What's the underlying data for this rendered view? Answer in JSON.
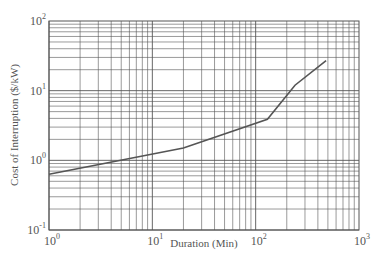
{
  "chart_data": {
    "type": "line",
    "title": "",
    "xlabel": "Duration (Min)",
    "ylabel": "Cost of Interruption ($/kW)",
    "xscale": "log",
    "yscale": "log",
    "xlim": [
      1,
      1000
    ],
    "ylim": [
      0.1,
      100
    ],
    "grid": true,
    "x_ticks": [
      {
        "base": "10",
        "exp": "0",
        "value": 1
      },
      {
        "base": "10",
        "exp": "1",
        "value": 10
      },
      {
        "base": "10",
        "exp": "2",
        "value": 100
      },
      {
        "base": "10",
        "exp": "3",
        "value": 1000
      }
    ],
    "y_ticks": [
      {
        "base": "10",
        "exp": "-1",
        "value": 0.1
      },
      {
        "base": "10",
        "exp": "0",
        "value": 1
      },
      {
        "base": "10",
        "exp": "1",
        "value": 10
      },
      {
        "base": "10",
        "exp": "2",
        "value": 100
      }
    ],
    "series": [
      {
        "name": "Cost of Interruption",
        "color": "#555555",
        "x": [
          1,
          20,
          130,
          240,
          480
        ],
        "y": [
          0.63,
          1.5,
          3.9,
          12,
          27
        ]
      }
    ],
    "legend": null
  },
  "colors": {
    "grid": "#555555",
    "line": "#555555",
    "background": "#ffffff"
  }
}
